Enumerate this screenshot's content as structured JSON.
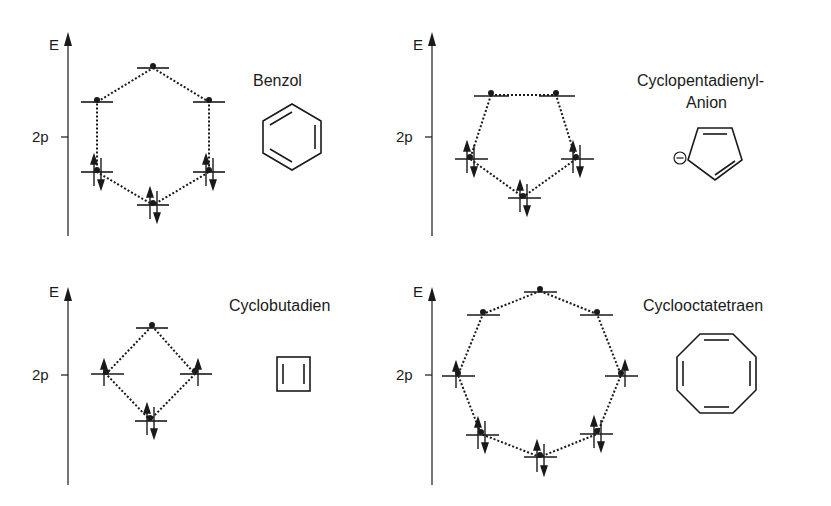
{
  "axis": {
    "energy_label": "E",
    "reference_label": "2p"
  },
  "panels": [
    {
      "name": "Benzol",
      "title": "Benzol",
      "levels": [
        {
          "x": 153,
          "y": 68,
          "electrons": "none"
        },
        {
          "x": 97,
          "y": 102,
          "electrons": "none"
        },
        {
          "x": 209,
          "y": 102,
          "electrons": "none"
        },
        {
          "x": 97,
          "y": 172,
          "electrons": "pair"
        },
        {
          "x": 209,
          "y": 172,
          "electrons": "pair"
        },
        {
          "x": 153,
          "y": 205,
          "electrons": "pair"
        }
      ]
    },
    {
      "name": "Cyclopentadienyl-Anion",
      "title_line1": "Cyclopentadienyl-",
      "title_line2": "Anion",
      "charge": "−",
      "levels": [
        {
          "x": 491,
          "y": 95,
          "electrons": "none"
        },
        {
          "x": 556,
          "y": 95,
          "electrons": "none"
        },
        {
          "x": 470,
          "y": 159,
          "electrons": "pair"
        },
        {
          "x": 576,
          "y": 159,
          "electrons": "pair"
        },
        {
          "x": 523,
          "y": 197,
          "electrons": "pair"
        }
      ]
    },
    {
      "name": "Cyclobutadien",
      "title": "Cyclobutadien",
      "levels": [
        {
          "x": 152,
          "y": 326,
          "electrons": "none"
        },
        {
          "x": 106,
          "y": 374,
          "electrons": "single"
        },
        {
          "x": 195,
          "y": 374,
          "electrons": "single"
        },
        {
          "x": 150,
          "y": 420,
          "electrons": "pair"
        }
      ]
    },
    {
      "name": "Cyclooctatetraen",
      "title": "Cyclooctatetraen",
      "levels": [
        {
          "x": 540,
          "y": 291,
          "electrons": "none"
        },
        {
          "x": 483,
          "y": 314,
          "electrons": "none"
        },
        {
          "x": 597,
          "y": 314,
          "electrons": "none"
        },
        {
          "x": 458,
          "y": 375,
          "electrons": "single"
        },
        {
          "x": 621,
          "y": 375,
          "electrons": "single"
        },
        {
          "x": 481,
          "y": 434,
          "electrons": "pair"
        },
        {
          "x": 597,
          "y": 434,
          "electrons": "pair"
        },
        {
          "x": 540,
          "y": 457,
          "electrons": "pair"
        }
      ]
    }
  ]
}
